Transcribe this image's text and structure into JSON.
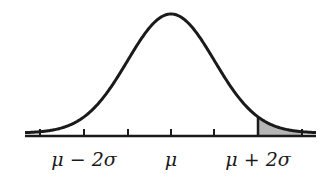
{
  "diagram": {
    "curve": {
      "type": "normal",
      "mean_x": 171,
      "sigma_px": 43.5,
      "baseline_y": 136,
      "peak_y": 14
    },
    "axis": {
      "x_start": 25,
      "x_end": 316,
      "ticks_x": [
        40,
        84,
        128,
        171,
        214,
        258,
        302
      ]
    },
    "shaded_region": {
      "from": "mu + 2 sigma",
      "to": "+infinity",
      "fill": "#b5b5b5"
    },
    "labels": [
      {
        "text": "μ − 2σ",
        "x": 84
      },
      {
        "text": "μ",
        "x": 171
      },
      {
        "text": "μ + 2σ",
        "x": 258
      }
    ],
    "colors": {
      "curve": "#1a1a1a",
      "shade": "#b5b5b5",
      "background": "#ffffff"
    }
  }
}
